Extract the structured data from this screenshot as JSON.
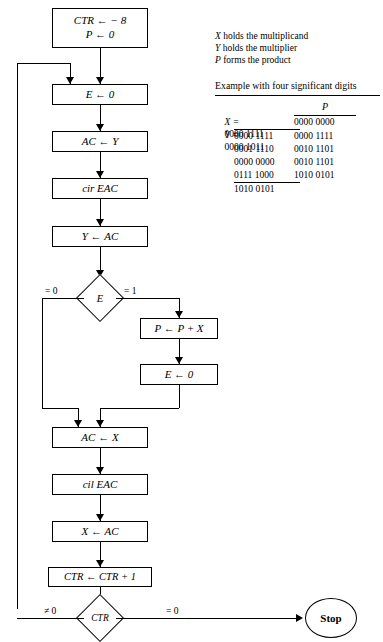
{
  "diagram": {
    "nodes": {
      "init": "CTR ← − 8\nP ← 0",
      "clear_e": "E ← 0",
      "ac_load_y": "AC ← Y",
      "cir_eac": "cir EAC",
      "y_store": "Y ← AC",
      "decision_e": "E",
      "add_x": "P ← P + X",
      "clear_e2": "E ← 0",
      "ac_load_x": "AC ← X",
      "cil_eac": "cil EAC",
      "x_store": "X ← AC",
      "incr_ctr": "CTR ← CTR + 1",
      "decision_ctr": "CTR",
      "stop": "Stop"
    },
    "edge_labels": {
      "e_zero": "= 0",
      "e_one": "= 1",
      "ctr_nonzero": "≠ 0",
      "ctr_zero": "= 0"
    }
  },
  "legend": {
    "lines": [
      {
        "var": "X",
        "text": " holds the multiplicand"
      },
      {
        "var": "Y",
        "text": " holds the multiplier"
      },
      {
        "var": "P",
        "text": " forms the product"
      }
    ]
  },
  "example": {
    "title": "Example with four significant digits",
    "column_header_right": "P",
    "rows": [
      {
        "label": "X =",
        "left": "0000 1111",
        "right": ""
      },
      {
        "label": "Y =",
        "left": "0000 1011",
        "right": "0000 0000"
      },
      {
        "label": "",
        "left": "0000 1111",
        "right": "0000 1111"
      },
      {
        "label": "",
        "left": "0001 1110",
        "right": "0010 1101"
      },
      {
        "label": "",
        "left": "0000 0000",
        "right": "0010 1101"
      },
      {
        "label": "",
        "left": "0111 1000",
        "right": "1010 0101"
      },
      {
        "label": "",
        "left": "1010 0101",
        "right": ""
      }
    ]
  }
}
